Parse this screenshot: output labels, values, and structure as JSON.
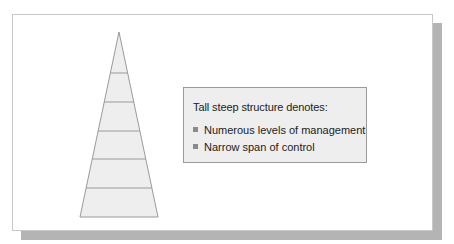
{
  "diagram": {
    "type": "pyramid",
    "levels": 6,
    "colors": {
      "fill": "#eeeeee",
      "stroke": "#9a9a9a",
      "shadow": "#b4b4b4",
      "bullet": "#8a8a8a"
    }
  },
  "textbox": {
    "heading": "Tall steep structure denotes:",
    "bullets": [
      {
        "text": "Numerous levels of management"
      },
      {
        "text": "Narrow span of control"
      }
    ]
  }
}
